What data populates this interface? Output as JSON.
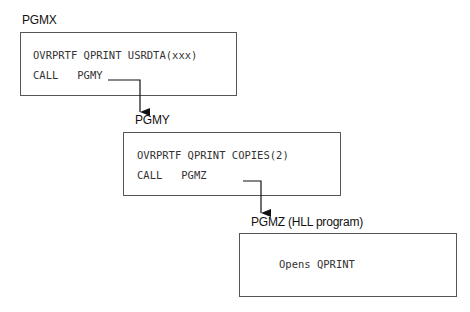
{
  "programs": [
    {
      "name": "PGMX",
      "lines": [
        "OVRPRTF QPRINT USRDTA(xxx)",
        "CALL   PGMY"
      ]
    },
    {
      "name": "PGMY",
      "lines": [
        "OVRPRTF QPRINT COPIES(2)",
        "CALL   PGMZ"
      ]
    },
    {
      "name": "PGMZ (HLL program)",
      "lines": [
        "Opens QPRINT"
      ]
    }
  ]
}
